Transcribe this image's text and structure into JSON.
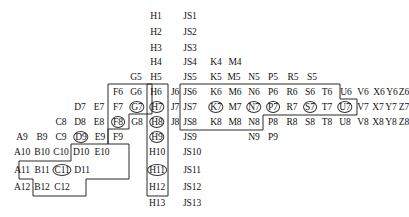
{
  "diagram": {
    "stroke_color": "#2b2b2b",
    "text_color": "#111111",
    "background": "#ffffff",
    "geometry": {
      "row_step": 16,
      "first_row_y": 16,
      "col_step_note": "columns are irregularly spaced, each label carries explicit x"
    },
    "rows": [
      1,
      2,
      3,
      4,
      5,
      6,
      7,
      8,
      9,
      10,
      11,
      12,
      13
    ],
    "columns": [
      "A",
      "B",
      "C",
      "D",
      "E",
      "F",
      "G",
      "H",
      "J",
      "JS",
      "K",
      "M",
      "N",
      "P",
      "R",
      "S",
      "T",
      "U",
      "V",
      "X",
      "Y",
      "Z"
    ],
    "cells": [
      {
        "label": "H1",
        "x": 156,
        "y": 16,
        "circled": false
      },
      {
        "label": "JS1",
        "x": 190,
        "y": 16,
        "circled": false
      },
      {
        "label": "H2",
        "x": 156,
        "y": 32,
        "circled": false
      },
      {
        "label": "JS2",
        "x": 190,
        "y": 32,
        "circled": false
      },
      {
        "label": "H3",
        "x": 156,
        "y": 48,
        "circled": false
      },
      {
        "label": "JS3",
        "x": 190,
        "y": 48,
        "circled": false
      },
      {
        "label": "H4",
        "x": 156,
        "y": 62,
        "circled": false
      },
      {
        "label": "JS4",
        "x": 190,
        "y": 62,
        "circled": false
      },
      {
        "label": "K4",
        "x": 216,
        "y": 62,
        "circled": false
      },
      {
        "label": "M4",
        "x": 235,
        "y": 62,
        "circled": false
      },
      {
        "label": "G5",
        "x": 136,
        "y": 77,
        "circled": false
      },
      {
        "label": "H5",
        "x": 156,
        "y": 77,
        "circled": false
      },
      {
        "label": "JS5",
        "x": 190,
        "y": 77,
        "circled": false
      },
      {
        "label": "K5",
        "x": 216,
        "y": 77,
        "circled": false
      },
      {
        "label": "M5",
        "x": 234,
        "y": 77,
        "circled": false
      },
      {
        "label": "N5",
        "x": 254,
        "y": 77,
        "circled": false
      },
      {
        "label": "P5",
        "x": 273,
        "y": 77,
        "circled": false
      },
      {
        "label": "R5",
        "x": 293,
        "y": 77,
        "circled": false
      },
      {
        "label": "S5",
        "x": 312,
        "y": 77,
        "circled": false
      },
      {
        "label": "F6",
        "x": 118,
        "y": 92,
        "circled": false
      },
      {
        "label": "G6",
        "x": 136,
        "y": 92,
        "circled": false
      },
      {
        "label": "H6",
        "x": 156,
        "y": 92,
        "circled": false
      },
      {
        "label": "J6",
        "x": 175,
        "y": 92,
        "circled": false
      },
      {
        "label": "JS6",
        "x": 190,
        "y": 92,
        "circled": false
      },
      {
        "label": "K6",
        "x": 216,
        "y": 92,
        "circled": false
      },
      {
        "label": "M6",
        "x": 235,
        "y": 92,
        "circled": false
      },
      {
        "label": "N6",
        "x": 254,
        "y": 92,
        "circled": false
      },
      {
        "label": "P6",
        "x": 273,
        "y": 92,
        "circled": false
      },
      {
        "label": "R6",
        "x": 292,
        "y": 92,
        "circled": false
      },
      {
        "label": "S6",
        "x": 310,
        "y": 92,
        "circled": false
      },
      {
        "label": "T6",
        "x": 327,
        "y": 92,
        "circled": false
      },
      {
        "label": "U6",
        "x": 346,
        "y": 92,
        "circled": false
      },
      {
        "label": "V6",
        "x": 363,
        "y": 92,
        "circled": false
      },
      {
        "label": "X6",
        "x": 379,
        "y": 92,
        "circled": false
      },
      {
        "label": "Y6",
        "x": 392,
        "y": 92,
        "circled": false
      },
      {
        "label": "Z6",
        "x": 404,
        "y": 92,
        "circled": false
      },
      {
        "label": "D7",
        "x": 80,
        "y": 107,
        "circled": false
      },
      {
        "label": "E7",
        "x": 99,
        "y": 107,
        "circled": false
      },
      {
        "label": "F7",
        "x": 118,
        "y": 107,
        "circled": false
      },
      {
        "label": "G7",
        "x": 137,
        "y": 107,
        "circled": true
      },
      {
        "label": "H7",
        "x": 157,
        "y": 107,
        "circled": true
      },
      {
        "label": "J7",
        "x": 175,
        "y": 107,
        "circled": false
      },
      {
        "label": "JS7",
        "x": 190,
        "y": 107,
        "circled": false
      },
      {
        "label": "K7",
        "x": 216,
        "y": 107,
        "circled": true
      },
      {
        "label": "M7",
        "x": 235,
        "y": 107,
        "circled": false
      },
      {
        "label": "N7",
        "x": 254,
        "y": 107,
        "circled": true
      },
      {
        "label": "P7",
        "x": 273,
        "y": 107,
        "circled": true
      },
      {
        "label": "R7",
        "x": 292,
        "y": 107,
        "circled": false
      },
      {
        "label": "S7",
        "x": 310,
        "y": 107,
        "circled": true
      },
      {
        "label": "T7",
        "x": 327,
        "y": 107,
        "circled": false
      },
      {
        "label": "U7",
        "x": 345,
        "y": 107,
        "circled": true
      },
      {
        "label": "V7",
        "x": 363,
        "y": 107,
        "circled": false
      },
      {
        "label": "X7",
        "x": 378,
        "y": 107,
        "circled": false
      },
      {
        "label": "Y7",
        "x": 391,
        "y": 107,
        "circled": false
      },
      {
        "label": "Z7",
        "x": 404,
        "y": 107,
        "circled": false
      },
      {
        "label": "C8",
        "x": 61,
        "y": 122,
        "circled": false
      },
      {
        "label": "D8",
        "x": 80,
        "y": 122,
        "circled": false
      },
      {
        "label": "E8",
        "x": 99,
        "y": 122,
        "circled": false
      },
      {
        "label": "F8",
        "x": 118,
        "y": 122,
        "circled": true
      },
      {
        "label": "G8",
        "x": 137,
        "y": 122,
        "circled": false
      },
      {
        "label": "H8",
        "x": 157,
        "y": 122,
        "circled": true
      },
      {
        "label": "J8",
        "x": 175,
        "y": 122,
        "circled": false
      },
      {
        "label": "JS8",
        "x": 190,
        "y": 122,
        "circled": false
      },
      {
        "label": "K8",
        "x": 216,
        "y": 122,
        "circled": false
      },
      {
        "label": "M8",
        "x": 235,
        "y": 122,
        "circled": false
      },
      {
        "label": "N8",
        "x": 254,
        "y": 122,
        "circled": false
      },
      {
        "label": "P8",
        "x": 273,
        "y": 122,
        "circled": false
      },
      {
        "label": "R8",
        "x": 292,
        "y": 122,
        "circled": false
      },
      {
        "label": "S8",
        "x": 310,
        "y": 122,
        "circled": false
      },
      {
        "label": "T8",
        "x": 327,
        "y": 122,
        "circled": false
      },
      {
        "label": "U8",
        "x": 345,
        "y": 122,
        "circled": false
      },
      {
        "label": "V8",
        "x": 363,
        "y": 122,
        "circled": false
      },
      {
        "label": "X8",
        "x": 378,
        "y": 122,
        "circled": false
      },
      {
        "label": "Y8",
        "x": 391,
        "y": 122,
        "circled": false
      },
      {
        "label": "Z8",
        "x": 404,
        "y": 122,
        "circled": false
      },
      {
        "label": "A9",
        "x": 22,
        "y": 137,
        "circled": false
      },
      {
        "label": "B9",
        "x": 42,
        "y": 137,
        "circled": false
      },
      {
        "label": "C9",
        "x": 61,
        "y": 137,
        "circled": false
      },
      {
        "label": "D9",
        "x": 81,
        "y": 137,
        "circled": true
      },
      {
        "label": "E9",
        "x": 100,
        "y": 137,
        "circled": false
      },
      {
        "label": "F9",
        "x": 118,
        "y": 137,
        "circled": false
      },
      {
        "label": "H9",
        "x": 157,
        "y": 137,
        "circled": true
      },
      {
        "label": "JS9",
        "x": 190,
        "y": 137,
        "circled": false
      },
      {
        "label": "N9",
        "x": 254,
        "y": 137,
        "circled": false
      },
      {
        "label": "P9",
        "x": 273,
        "y": 137,
        "circled": false
      },
      {
        "label": "A10",
        "x": 22,
        "y": 152,
        "circled": false
      },
      {
        "label": "B10",
        "x": 42,
        "y": 152,
        "circled": false
      },
      {
        "label": "C10",
        "x": 61,
        "y": 152,
        "circled": false
      },
      {
        "label": "D10",
        "x": 81,
        "y": 152,
        "circled": false
      },
      {
        "label": "E10",
        "x": 102,
        "y": 152,
        "circled": false
      },
      {
        "label": "H10",
        "x": 157,
        "y": 152,
        "circled": false
      },
      {
        "label": "JS10",
        "x": 192,
        "y": 152,
        "circled": false
      },
      {
        "label": "A11",
        "x": 22,
        "y": 170,
        "circled": false
      },
      {
        "label": "B11",
        "x": 42,
        "y": 170,
        "circled": false
      },
      {
        "label": "C11",
        "x": 62,
        "y": 170,
        "circled": true
      },
      {
        "label": "D11",
        "x": 82,
        "y": 170,
        "circled": false
      },
      {
        "label": "H11",
        "x": 157,
        "y": 170,
        "circled": true
      },
      {
        "label": "JS11",
        "x": 192,
        "y": 170,
        "circled": false
      },
      {
        "label": "A12",
        "x": 22,
        "y": 187,
        "circled": false
      },
      {
        "label": "B12",
        "x": 42,
        "y": 187,
        "circled": false
      },
      {
        "label": "C12",
        "x": 62,
        "y": 187,
        "circled": false
      },
      {
        "label": "H12",
        "x": 157,
        "y": 187,
        "circled": false
      },
      {
        "label": "JS12",
        "x": 192,
        "y": 187,
        "circled": false
      },
      {
        "label": "H13",
        "x": 157,
        "y": 203,
        "circled": false
      },
      {
        "label": "JS13",
        "x": 192,
        "y": 203,
        "circled": false
      }
    ],
    "regions": [
      {
        "name": "left-stepped-region",
        "points": "108,84 152,84 152,114 129,114 129,129 108,129 108,144 71,144 71,161 19,161 19,179 33,179 33,195 86,195 86,179 129,179 129,129 129,144 108,144"
      },
      {
        "name": "h-column-region",
        "points": "147,84 168,84 168,195 147,195"
      },
      {
        "name": "right-block-region",
        "points": "180,84 340,84 340,99 357,99 357,114 263,114 263,129 180,129"
      }
    ]
  }
}
